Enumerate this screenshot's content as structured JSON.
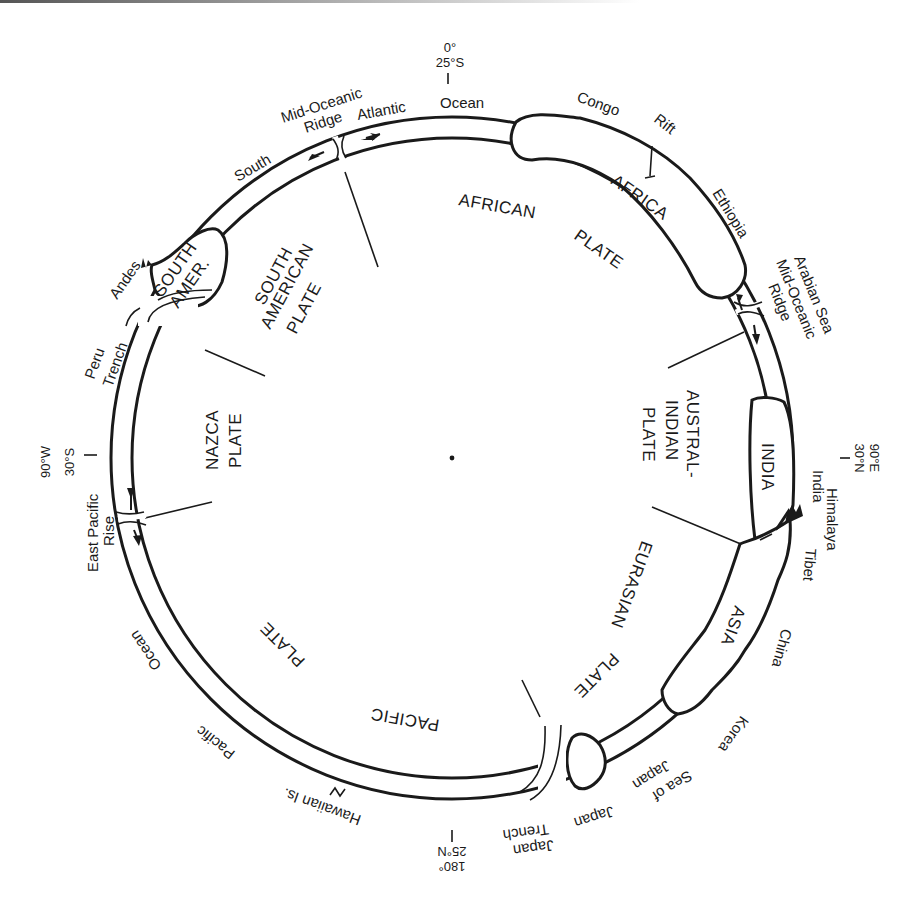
{
  "figure": {
    "center_dot": true
  },
  "plates": [
    {
      "id": "african",
      "lines": [
        "AFRICAN",
        "PLATE"
      ]
    },
    {
      "id": "austral-indian",
      "lines": [
        "AUSTRAL-",
        "INDIAN",
        "PLATE"
      ]
    },
    {
      "id": "eurasian",
      "lines": [
        "EURASIAN",
        "PLATE"
      ]
    },
    {
      "id": "pacific",
      "lines": [
        "PACIFIC",
        "PLATE"
      ]
    },
    {
      "id": "nazca",
      "lines": [
        "NAZCA",
        "PLATE"
      ]
    },
    {
      "id": "south-american",
      "lines": [
        "SOUTH",
        "AMERICAN",
        "PLATE"
      ]
    }
  ],
  "continents": {
    "africa": "AFRICA",
    "india": "INDIA",
    "asia": "ASIA",
    "south_america": [
      "SOUTH",
      "AMER."
    ]
  },
  "coordinates": {
    "top": [
      "0°",
      "25°S"
    ],
    "right": [
      "90°E",
      "30°N"
    ],
    "bottom": [
      "180°",
      "25°N"
    ],
    "left": [
      "90°W",
      "30°S"
    ]
  },
  "features": {
    "ocean_top": "Ocean",
    "atlantic": "Atlantic",
    "mid_oceanic_ridge_atl": [
      "Mid-Oceanic",
      "Ridge"
    ],
    "south": "South",
    "congo": "Congo",
    "rift": "Rift",
    "ethiopia": "Ethiopia",
    "arabian_ridge": [
      "Arabian Sea",
      "Mid-Oceanic",
      "Ridge"
    ],
    "india_outer": "India",
    "himalaya": "Himalaya",
    "tibet": "Tibet",
    "china": "China",
    "korea": "Korea",
    "sea_of_japan": [
      "Sea of",
      "Japan"
    ],
    "japan": "Japan",
    "japan_trench": [
      "Japan",
      "Trench"
    ],
    "hawaiian": "Hawaiian Is.",
    "pacific": "Pacific",
    "ocean_left": "Ocean",
    "east_pacific_rise": [
      "East Pacific",
      "Rise"
    ],
    "peru_trench": [
      "Peru",
      "Trench"
    ],
    "andes": "Andes"
  }
}
